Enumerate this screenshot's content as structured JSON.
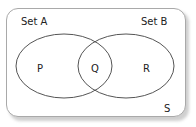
{
  "diagram": {
    "type": "venn",
    "universal_set": {
      "label": "S"
    },
    "sets": [
      {
        "id": "A",
        "label": "Set A"
      },
      {
        "id": "B",
        "label": "Set B"
      }
    ],
    "regions": [
      {
        "id": "P",
        "label": "P",
        "description": "A only"
      },
      {
        "id": "Q",
        "label": "Q",
        "description": "A and B"
      },
      {
        "id": "R",
        "label": "R",
        "description": "B only"
      }
    ],
    "colors": {
      "stroke": "#555555",
      "frame": "#a9a9a9",
      "text": "#222222",
      "background": "#ffffff"
    }
  }
}
